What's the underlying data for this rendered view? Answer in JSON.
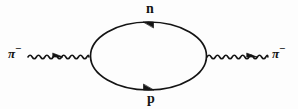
{
  "figure": {
    "background_color": "#fdfdfd",
    "line_color": "#141414",
    "width": 298,
    "height": 109
  },
  "labels": {
    "top_fermion": "n",
    "bottom_fermion": "p",
    "incoming_meson_symbol": "π",
    "incoming_meson_charge": "−",
    "outgoing_meson_symbol": "π",
    "outgoing_meson_charge": "−"
  },
  "elements": {
    "incoming_wavy_line": "pion-propagator-in",
    "outgoing_wavy_line": "pion-propagator-out",
    "loop": "nucleon-loop",
    "left_vertex": "vertex-left",
    "right_vertex": "vertex-right",
    "top_arrow_direction": "left",
    "bottom_arrow_direction": "right",
    "incoming_arrow_direction": "right",
    "outgoing_arrow_direction": "right"
  },
  "geometry": {
    "loop_center_x": 148.5,
    "loop_center_y": 56,
    "loop_radius_x": 58,
    "loop_radius_y": 34,
    "wavy_left_start_x": 28,
    "wavy_left_end_x": 90,
    "wavy_right_start_x": 207,
    "wavy_right_end_x": 269,
    "wavy_baseline_y": 57,
    "wavy_amplitude": 3.6,
    "wavy_wavelength": 8.4
  }
}
